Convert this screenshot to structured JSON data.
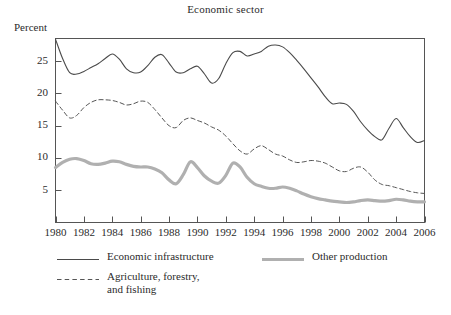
{
  "chart_data": {
    "type": "line",
    "title": "Economic sector",
    "xlabel": "",
    "ylabel": "Percent",
    "ylim": [
      0,
      28.5
    ],
    "xlim": [
      1980,
      2006
    ],
    "grid": false,
    "legend_position": "below",
    "yticks": [
      5,
      10,
      15,
      20,
      25
    ],
    "ytick_labels": [
      "5",
      "10",
      "15",
      "20",
      "25"
    ],
    "xticks": [
      1980,
      1982,
      1984,
      1986,
      1988,
      1990,
      1992,
      1994,
      1996,
      1998,
      2000,
      2002,
      2004,
      2006
    ],
    "xtick_labels": [
      "1980",
      "1982",
      "1984",
      "1986",
      "1988",
      "1990",
      "1992",
      "1994",
      "1996",
      "1998",
      "2000",
      "2002",
      "2004",
      "2006"
    ],
    "x": [
      1980,
      1980.5,
      1981,
      1981.5,
      1982,
      1982.5,
      1983,
      1983.5,
      1984,
      1984.5,
      1985,
      1985.5,
      1986,
      1986.5,
      1987,
      1987.5,
      1988,
      1988.5,
      1989,
      1989.5,
      1990,
      1990.5,
      1991,
      1991.5,
      1992,
      1992.5,
      1993,
      1993.5,
      1994,
      1994.5,
      1995,
      1995.5,
      1996,
      1996.5,
      1997,
      1997.5,
      1998,
      1998.5,
      1999,
      1999.5,
      2000,
      2000.5,
      2001,
      2001.5,
      2002,
      2002.5,
      2003,
      2003.5,
      2004,
      2004.5,
      2005,
      2005.5,
      2006
    ],
    "series": [
      {
        "name": "Economic infrastructure",
        "style": "solid",
        "color": "#4a4a4a",
        "width": 1.1,
        "values": [
          28.4,
          25.4,
          23.2,
          23.0,
          23.4,
          24.0,
          24.6,
          25.4,
          26.1,
          25.3,
          23.8,
          23.2,
          23.3,
          24.3,
          25.6,
          26.0,
          24.7,
          23.3,
          23.2,
          23.8,
          24.2,
          23.0,
          21.6,
          22.3,
          24.6,
          26.3,
          26.5,
          25.8,
          26.1,
          26.5,
          27.3,
          27.5,
          27.2,
          26.3,
          25.1,
          23.8,
          22.4,
          21.0,
          19.5,
          18.4,
          18.5,
          18.3,
          17.2,
          15.6,
          14.3,
          13.3,
          12.8,
          14.6,
          16.1,
          14.7,
          13.3,
          12.4,
          12.7
        ]
      },
      {
        "name": "Agriculture, forestry,\nand fishing",
        "style": "dashed",
        "color": "#555555",
        "width": 1.0,
        "values": [
          18.8,
          17.4,
          16.2,
          16.6,
          17.8,
          18.6,
          19.0,
          19.0,
          18.9,
          18.6,
          18.2,
          18.4,
          18.8,
          18.6,
          17.5,
          16.2,
          15.0,
          14.7,
          15.8,
          16.2,
          15.8,
          15.4,
          14.8,
          14.3,
          13.4,
          12.2,
          11.1,
          10.6,
          11.4,
          11.9,
          11.3,
          10.6,
          10.3,
          9.7,
          9.3,
          9.4,
          9.6,
          9.5,
          9.2,
          8.6,
          8.0,
          7.9,
          8.4,
          8.6,
          7.8,
          6.6,
          5.9,
          5.7,
          5.4,
          5.1,
          4.8,
          4.6,
          4.5
        ]
      },
      {
        "name": "Other production",
        "style": "solid",
        "color": "#b0b0b0",
        "width": 3.2,
        "values": [
          8.5,
          9.3,
          9.8,
          9.9,
          9.6,
          9.1,
          9.0,
          9.2,
          9.5,
          9.4,
          9.0,
          8.7,
          8.6,
          8.6,
          8.3,
          7.7,
          6.6,
          6.0,
          7.4,
          9.4,
          8.5,
          7.2,
          6.4,
          6.1,
          7.3,
          9.2,
          8.6,
          7.0,
          6.0,
          5.6,
          5.3,
          5.3,
          5.5,
          5.3,
          4.9,
          4.4,
          4.0,
          3.7,
          3.5,
          3.3,
          3.2,
          3.1,
          3.2,
          3.4,
          3.5,
          3.4,
          3.3,
          3.4,
          3.6,
          3.5,
          3.3,
          3.2,
          3.2
        ]
      }
    ]
  },
  "legend": {
    "items": [
      {
        "label": "Economic infrastructure",
        "style": "solid-thin"
      },
      {
        "label": "Agriculture, forestry,\nand fishing",
        "style": "dashed"
      },
      {
        "label": "Other production",
        "style": "solid-thick"
      }
    ]
  },
  "colors": {
    "frame": "#555555",
    "line_solid": "#4a4a4a",
    "line_dashed": "#555555",
    "line_thick": "#b0b0b0",
    "text": "#2b2b2b",
    "background": "#ffffff"
  }
}
